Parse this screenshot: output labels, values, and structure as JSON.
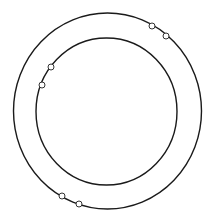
{
  "diagram": {
    "background": "#ffffff",
    "stroke_color": "#1a1a1a",
    "node_fill": "#ffffff",
    "node_stroke": "#333333",
    "rings": [
      {
        "name": "outer-ring",
        "cx": 107.5,
        "cy": 111,
        "rx": 94,
        "ry": 98,
        "stroke_width": 1.4
      },
      {
        "name": "inner-ring",
        "cx": 106.5,
        "cy": 111.5,
        "rx": 70.5,
        "ry": 73.5,
        "stroke_width": 1.4
      }
    ],
    "nodes": [
      {
        "ring": "outer",
        "cx": 152,
        "cy": 26,
        "r": 3
      },
      {
        "ring": "outer",
        "cx": 166,
        "cy": 36,
        "r": 3
      },
      {
        "ring": "inner",
        "cx": 51,
        "cy": 67,
        "r": 3
      },
      {
        "ring": "inner",
        "cx": 42,
        "cy": 85,
        "r": 3
      },
      {
        "ring": "outer",
        "cx": 62,
        "cy": 196,
        "r": 3
      },
      {
        "ring": "outer",
        "cx": 79,
        "cy": 204,
        "r": 3
      }
    ]
  }
}
